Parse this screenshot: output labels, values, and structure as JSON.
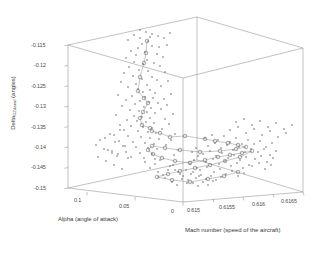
{
  "figure": {
    "type": "3d-scatter",
    "background": "#ffffff",
    "axis_color": "#8a8a8a",
    "marker_color": "#555555",
    "path_color": "#888888"
  },
  "axes": {
    "x": {
      "label": "Alpha (angle of attack)",
      "ticks": [
        "0.1",
        "0.05",
        "0"
      ],
      "values": [
        0.1,
        0.05,
        0
      ],
      "range": [
        0.1,
        0
      ]
    },
    "y": {
      "label_main": "Delta",
      "label_sub": "CZdanal",
      "label_unit": " (angles)",
      "label_full": "Delta_CZdanal (angles)",
      "ticks": [
        "-0.115",
        "-0.12",
        "-0.125",
        "-0.13",
        "-0.135",
        "-0.14",
        "-0.145",
        "-0.15"
      ],
      "values": [
        -0.115,
        -0.12,
        -0.125,
        -0.13,
        -0.135,
        -0.14,
        -0.145,
        -0.15
      ],
      "range": [
        -0.115,
        -0.15
      ]
    },
    "z": {
      "label": "Mach number (speed of the aircraft)",
      "ticks": [
        "0.615",
        "0.6155",
        "0.616",
        "0.6165"
      ],
      "values": [
        0.615,
        0.6155,
        0.616,
        0.6165
      ],
      "range": [
        0.615,
        0.6165
      ]
    }
  },
  "chart_data": {
    "type": "scatter",
    "title": "",
    "xlabel": "Alpha (angle of attack)",
    "ylabel": "Delta_CZdanal (angles)",
    "zlabel": "Mach number (speed of the aircraft)",
    "xlim": [
      0.1,
      0.0
    ],
    "ylim": [
      -0.15,
      -0.115
    ],
    "zlim": [
      0.615,
      0.6165
    ],
    "grid": false,
    "legend": "none",
    "series": [
      {
        "name": "data points",
        "marker": "dot",
        "points_screen": [
          [
            142,
            44
          ],
          [
            148,
            41
          ],
          [
            152,
            46
          ],
          [
            138,
            48
          ],
          [
            159,
            47
          ],
          [
            131,
            51
          ],
          [
            145,
            52
          ],
          [
            167,
            45
          ],
          [
            140,
            38
          ],
          [
            150,
            37
          ],
          [
            136,
            55
          ],
          [
            157,
            54
          ],
          [
            126,
            58
          ],
          [
            163,
            57
          ],
          [
            147,
            60
          ],
          [
            134,
            62
          ],
          [
            143,
            64
          ],
          [
            154,
            63
          ],
          [
            129,
            67
          ],
          [
            160,
            66
          ],
          [
            139,
            70
          ],
          [
            148,
            71
          ],
          [
            124,
            73
          ],
          [
            165,
            72
          ],
          [
            133,
            76
          ],
          [
            152,
            77
          ],
          [
            142,
            79
          ],
          [
            157,
            80
          ],
          [
            121,
            82
          ],
          [
            168,
            81
          ],
          [
            136,
            84
          ],
          [
            147,
            85
          ],
          [
            128,
            87
          ],
          [
            161,
            86
          ],
          [
            138,
            89
          ],
          [
            150,
            90
          ],
          [
            143,
            92
          ],
          [
            155,
            93
          ],
          [
            118,
            95
          ],
          [
            171,
            94
          ],
          [
            132,
            96
          ],
          [
            145,
            97
          ],
          [
            153,
            98
          ],
          [
            126,
            100
          ],
          [
            164,
            99
          ],
          [
            140,
            101
          ],
          [
            149,
            102
          ],
          [
            135,
            104
          ],
          [
            158,
            103
          ],
          [
            122,
            106
          ],
          [
            167,
            105
          ],
          [
            144,
            107
          ],
          [
            151,
            108
          ],
          [
            130,
            110
          ],
          [
            161,
            109
          ],
          [
            139,
            111
          ],
          [
            147,
            112
          ],
          [
            155,
            113
          ],
          [
            116,
            115
          ],
          [
            173,
            114
          ],
          [
            134,
            116
          ],
          [
            142,
            117
          ],
          [
            150,
            118
          ],
          [
            127,
            120
          ],
          [
            165,
            119
          ],
          [
            137,
            121
          ],
          [
            146,
            122
          ],
          [
            154,
            123
          ],
          [
            120,
            125
          ],
          [
            169,
            124
          ],
          [
            131,
            126
          ],
          [
            143,
            127
          ],
          [
            152,
            128
          ],
          [
            124,
            130
          ],
          [
            162,
            129
          ],
          [
            138,
            131
          ],
          [
            148,
            132
          ],
          [
            156,
            133
          ],
          [
            114,
            135
          ],
          [
            175,
            134
          ],
          [
            128,
            136
          ],
          [
            141,
            137
          ],
          [
            150,
            138
          ],
          [
            159,
            139
          ],
          [
            119,
            141
          ],
          [
            171,
            140
          ],
          [
            133,
            142
          ],
          [
            145,
            143
          ],
          [
            154,
            144
          ],
          [
            123,
            146
          ],
          [
            166,
            145
          ],
          [
            136,
            147
          ],
          [
            148,
            148
          ],
          [
            157,
            149
          ],
          [
            112,
            151
          ],
          [
            178,
            150
          ],
          [
            126,
            152
          ],
          [
            140,
            153
          ],
          [
            152,
            154
          ],
          [
            117,
            156
          ],
          [
            174,
            155
          ],
          [
            131,
            157
          ],
          [
            144,
            158
          ],
          [
            155,
            159
          ],
          [
            205,
            138
          ],
          [
            212,
            135
          ],
          [
            218,
            140
          ],
          [
            224,
            136
          ],
          [
            230,
            142
          ],
          [
            236,
            138
          ],
          [
            242,
            144
          ],
          [
            248,
            140
          ],
          [
            208,
            146
          ],
          [
            215,
            143
          ],
          [
            221,
            148
          ],
          [
            227,
            145
          ],
          [
            233,
            150
          ],
          [
            239,
            147
          ],
          [
            245,
            152
          ],
          [
            251,
            149
          ],
          [
            203,
            154
          ],
          [
            210,
            151
          ],
          [
            216,
            156
          ],
          [
            222,
            153
          ],
          [
            228,
            158
          ],
          [
            234,
            155
          ],
          [
            240,
            160
          ],
          [
            246,
            157
          ],
          [
            206,
            162
          ],
          [
            213,
            159
          ],
          [
            219,
            164
          ],
          [
            225,
            161
          ],
          [
            231,
            166
          ],
          [
            237,
            163
          ],
          [
            243,
            168
          ],
          [
            249,
            165
          ],
          [
            200,
            170
          ],
          [
            207,
            167
          ],
          [
            214,
            172
          ],
          [
            220,
            169
          ],
          [
            226,
            174
          ],
          [
            232,
            171
          ],
          [
            238,
            176
          ],
          [
            244,
            173
          ],
          [
            254,
            144
          ],
          [
            260,
            141
          ],
          [
            266,
            147
          ],
          [
            272,
            143
          ],
          [
            258,
            152
          ],
          [
            264,
            149
          ],
          [
            270,
            155
          ],
          [
            276,
            151
          ],
          [
            255,
            159
          ],
          [
            261,
            156
          ],
          [
            267,
            162
          ],
          [
            273,
            158
          ],
          [
            252,
            166
          ],
          [
            259,
            163
          ],
          [
            265,
            169
          ],
          [
            271,
            165
          ],
          [
            196,
            148
          ],
          [
            192,
            152
          ],
          [
            198,
            156
          ],
          [
            194,
            160
          ],
          [
            190,
            164
          ],
          [
            197,
            168
          ],
          [
            193,
            172
          ],
          [
            199,
            176
          ],
          [
            186,
            170
          ],
          [
            191,
            174
          ],
          [
            196,
            178
          ],
          [
            201,
            175
          ],
          [
            206,
            179
          ],
          [
            211,
            176
          ],
          [
            216,
            180
          ],
          [
            221,
            177
          ],
          [
            178,
            172
          ],
          [
            183,
            176
          ],
          [
            188,
            180
          ],
          [
            193,
            183
          ],
          [
            198,
            186
          ],
          [
            203,
            182
          ],
          [
            208,
            185
          ],
          [
            213,
            181
          ],
          [
            170,
            166
          ],
          [
            175,
            170
          ],
          [
            180,
            174
          ],
          [
            165,
            178
          ],
          [
            172,
            182
          ],
          [
            177,
            185
          ],
          [
            182,
            179
          ],
          [
            187,
            183
          ],
          [
            160,
            160
          ],
          [
            155,
            164
          ],
          [
            150,
            168
          ],
          [
            145,
            162
          ],
          [
            158,
            172
          ],
          [
            163,
            175
          ],
          [
            168,
            170
          ],
          [
            173,
            165
          ],
          [
            120,
            130
          ],
          [
            110,
            134
          ],
          [
            105,
            138
          ],
          [
            115,
            142
          ],
          [
            125,
            146
          ],
          [
            108,
            150
          ],
          [
            118,
            154
          ],
          [
            128,
            158
          ],
          [
            100,
            140
          ],
          [
            96,
            145
          ],
          [
            104,
            149
          ],
          [
            112,
            153
          ],
          [
            98,
            157
          ],
          [
            106,
            161
          ],
          [
            114,
            165
          ],
          [
            122,
            169
          ],
          [
            230,
            130
          ],
          [
            238,
            127
          ],
          [
            246,
            133
          ],
          [
            254,
            129
          ],
          [
            262,
            135
          ],
          [
            270,
            131
          ],
          [
            278,
            137
          ],
          [
            286,
            133
          ],
          [
            236,
            122
          ],
          [
            244,
            119
          ],
          [
            252,
            125
          ],
          [
            260,
            121
          ],
          [
            268,
            127
          ],
          [
            276,
            123
          ],
          [
            284,
            129
          ],
          [
            292,
            125
          ],
          [
            152,
            34
          ],
          [
            146,
            32
          ],
          [
            158,
            36
          ],
          [
            140,
            30
          ],
          [
            164,
            38
          ],
          [
            134,
            35
          ],
          [
            170,
            33
          ],
          [
            128,
            40
          ]
        ]
      },
      {
        "name": "connected path",
        "marker": "circle",
        "linked": true,
        "points_screen": [
          [
            147,
            41
          ],
          [
            146,
            53
          ],
          [
            144,
            63
          ],
          [
            140,
            77
          ],
          [
            138,
            91
          ],
          [
            144,
            98
          ],
          [
            148,
            103
          ],
          [
            143,
            112
          ],
          [
            140,
            118
          ],
          [
            142,
            125
          ],
          [
            150,
            128
          ],
          [
            152,
            131
          ],
          [
            160,
            133
          ],
          [
            170,
            137
          ],
          [
            185,
            136
          ],
          [
            205,
            139
          ],
          [
            215,
            141
          ],
          [
            228,
            143
          ],
          [
            238,
            145
          ],
          [
            246,
            147
          ],
          [
            236,
            149
          ],
          [
            220,
            151
          ],
          [
            200,
            152
          ],
          [
            180,
            150
          ],
          [
            165,
            148
          ],
          [
            152,
            146
          ],
          [
            148,
            150
          ],
          [
            153,
            154
          ],
          [
            162,
            158
          ],
          [
            175,
            161
          ],
          [
            190,
            163
          ],
          [
            205,
            160
          ],
          [
            218,
            157
          ],
          [
            230,
            155
          ],
          [
            242,
            153
          ],
          [
            252,
            151
          ],
          [
            240,
            157
          ],
          [
            225,
            161
          ],
          [
            210,
            165
          ],
          [
            195,
            168
          ],
          [
            180,
            171
          ],
          [
            168,
            174
          ],
          [
            157,
            177
          ],
          [
            172,
            180
          ],
          [
            190,
            182
          ],
          [
            208,
            179
          ],
          [
            224,
            176
          ],
          [
            238,
            172
          ]
        ]
      }
    ]
  }
}
